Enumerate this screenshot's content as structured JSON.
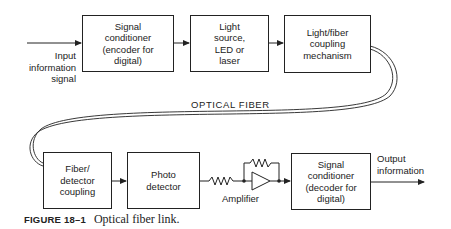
{
  "figure": {
    "number_label": "FIGURE 18–1",
    "caption": "Optical fiber link."
  },
  "transmitter": {
    "input_label": "Input\ninformation\nsignal",
    "blocks": [
      {
        "id": "encoder",
        "text": "Signal\nconditioner\n(encoder for\ndigital)"
      },
      {
        "id": "light-source",
        "text": "Light\nsource,\nLED or\nlaser"
      },
      {
        "id": "light-fiber-coupling",
        "text": "Light/fiber\ncoupling\nmechanism"
      }
    ]
  },
  "fiber": {
    "label": "OPTICAL FIBER"
  },
  "receiver": {
    "blocks": [
      {
        "id": "fiber-detector-coupling",
        "text": "Fiber/\ndetector\ncoupling"
      },
      {
        "id": "photo-detector",
        "text": "Photo\ndetector"
      },
      {
        "id": "decoder",
        "text": "Signal\nconditioner\n(decoder for\ndigital)"
      }
    ],
    "amplifier_label": "Amplifier",
    "output_label": "Output\ninformation"
  },
  "colors": {
    "line": "#222222",
    "background": "#ffffff"
  }
}
